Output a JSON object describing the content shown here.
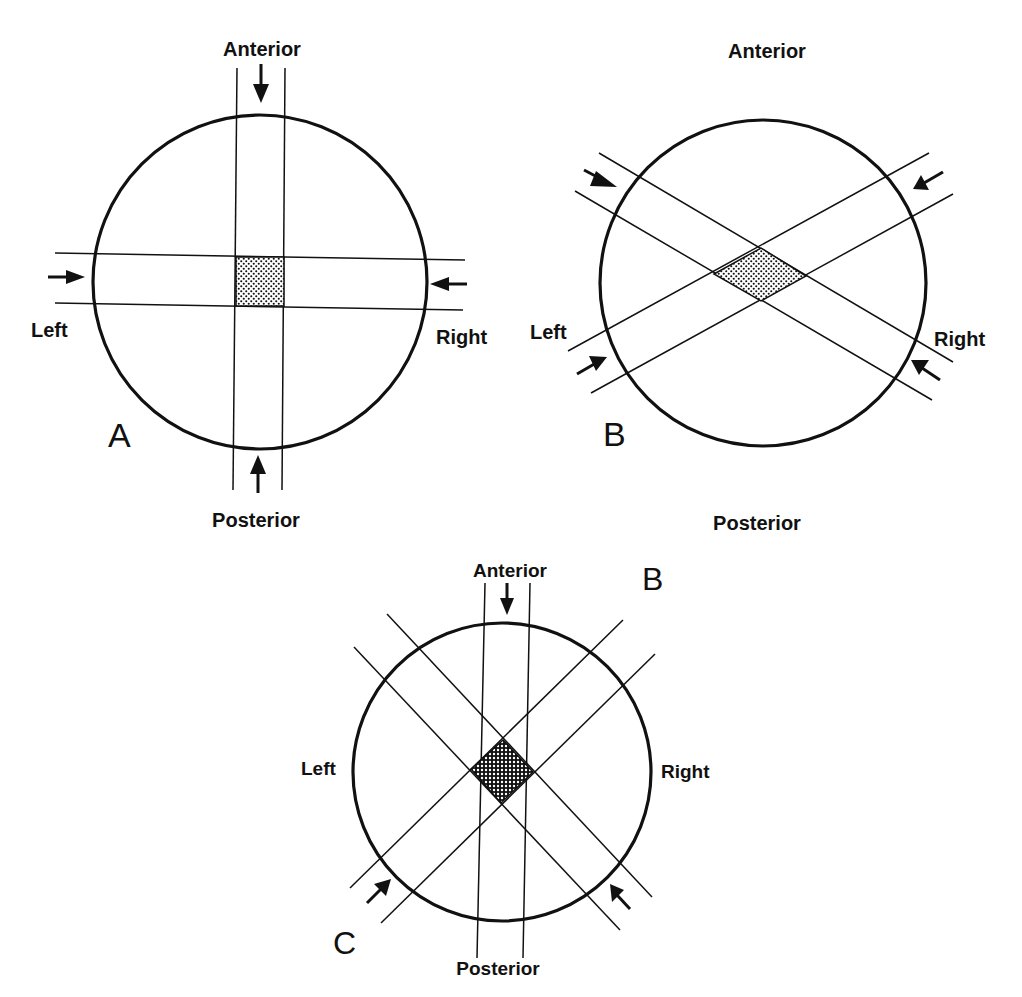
{
  "figure": {
    "colors": {
      "ink": "#111111",
      "background": "#ffffff"
    }
  },
  "panels": [
    {
      "id": "A",
      "panel_label": "A",
      "orientation_labels": {
        "top": "Anterior",
        "bottom": "Posterior",
        "left": "Left",
        "right": "Right"
      },
      "beams": [
        "anterior-posterior parallel pair",
        "left-right parallel pair"
      ],
      "overlap_shape": "square"
    },
    {
      "id": "B",
      "panel_label": "B",
      "orientation_labels": {
        "top": "Anterior",
        "bottom": "Posterior",
        "left": "Left",
        "right": "Right"
      },
      "beams": [
        "oblique pair (upper-left / lower-right)",
        "oblique pair (lower-left / upper-right)"
      ],
      "overlap_shape": "diamond"
    },
    {
      "id": "C",
      "panel_label": "C",
      "extra_label": "B",
      "orientation_labels": {
        "top": "Anterior",
        "bottom": "Posterior",
        "left": "Left",
        "right": "Right"
      },
      "beams": [
        "anterior vertical beam",
        "left posterior oblique beam",
        "right posterior oblique beam"
      ],
      "overlap_shape": "diamond"
    }
  ]
}
